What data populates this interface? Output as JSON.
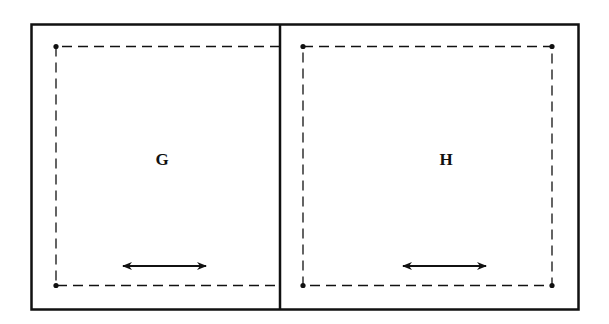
{
  "diagram": {
    "colors": {
      "stroke": "#111111",
      "background": "#ffffff"
    },
    "panels": [
      {
        "id": "G",
        "label": "G",
        "arrow": "double-headed-horizontal"
      },
      {
        "id": "H",
        "label": "H",
        "arrow": "double-headed-horizontal"
      }
    ]
  }
}
